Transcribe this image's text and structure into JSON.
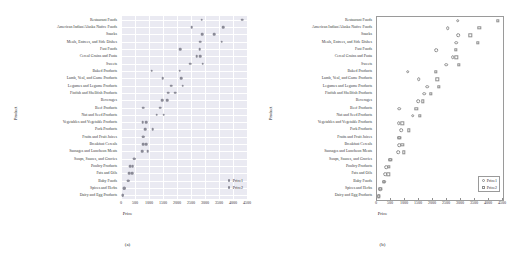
{
  "figure": {
    "panels": [
      {
        "id": "a",
        "caption": "(a)",
        "style": "darkgrid-filled"
      },
      {
        "id": "b",
        "caption": "(b)",
        "style": "classic-open"
      }
    ]
  },
  "axes": {
    "xlabel": "Price",
    "ylabel": "Product",
    "xticks": [
      "0",
      "500",
      "1000",
      "1500",
      "2000",
      "2500",
      "3000",
      "3500",
      "4000",
      "4500"
    ],
    "xlim": [
      0,
      4500
    ],
    "grid": true
  },
  "legend": {
    "entries": [
      {
        "label": "Price1",
        "marker_a": "filled-dot",
        "marker_b": "open-circle"
      },
      {
        "label": "Price2",
        "marker_a": "filled-dot",
        "marker_b": "open-square"
      }
    ]
  },
  "colors": {
    "panel_a_background": "#eaeaf2",
    "panel_b_background": "#ffffff",
    "marker": "#8a8a96",
    "grid": "#ffffff",
    "spine": "#9a9a9a",
    "text": "#2b2b2b"
  },
  "chart_data": {
    "type": "scatter",
    "title": "",
    "xlabel": "Price",
    "ylabel": "Product",
    "xlim": [
      0,
      4500
    ],
    "grid": true,
    "legend_position": "lower-right",
    "categories": [
      "Restaurant Foods",
      "American Indian/Alaska Native Foods",
      "Snacks",
      "Meals, Entrees, and Side Dishes",
      "Fast Foods",
      "Cereal Grains and Pasta",
      "Sweets",
      "Baked Products",
      "Lamb, Veal, and Game Products",
      "Legumes and Legume Products",
      "Finfish and Shellfish Products",
      "Beverages",
      "Beef Products",
      "Nut and Seed Products",
      "Vegetables and Vegetable Products",
      "Pork Products",
      "Fruits and Fruit Juices",
      "Breakfast Cereals",
      "Sausages and Luncheon Meats",
      "Soups, Sauces, and Gravies",
      "Poultry Products",
      "Fats and Oils",
      "Baby Foods",
      "Spices and Herbs",
      "Dairy and Egg Products"
    ],
    "series": [
      {
        "name": "Price1",
        "marker": "circle",
        "values": [
          2880,
          2530,
          2890,
          2830,
          2120,
          2700,
          2470,
          1090,
          1490,
          1800,
          1680,
          1480,
          790,
          1280,
          780,
          870,
          800,
          790,
          760,
          480,
          320,
          300,
          250,
          120,
          60
        ]
      },
      {
        "name": "Price2",
        "marker": "square",
        "values": [
          4320,
          3650,
          3330,
          3590,
          2810,
          2830,
          2920,
          2090,
          2150,
          2210,
          1930,
          1640,
          1400,
          1520,
          900,
          1130,
          800,
          900,
          950,
          480,
          420,
          400,
          250,
          120,
          60
        ]
      }
    ]
  }
}
